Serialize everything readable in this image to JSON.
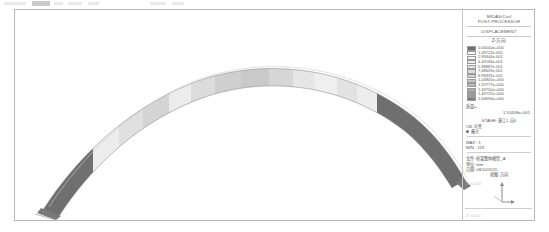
{
  "window": {
    "title": "MIDAS/Civil Post-Processor Displacement Contour"
  },
  "legend": {
    "header_lines": [
      "MIDAS/Civil",
      "POST-PROCESSOR",
      "DISPLACEMENT"
    ],
    "component": "Z-方向",
    "scale_rows": [
      {
        "value": "0.00000e+000",
        "color": "#6f6f6f"
      },
      {
        "value": "1.49722e-001",
        "color": "#ffffff"
      },
      {
        "value": "2.99444e-001",
        "color": "#f4f4f4"
      },
      {
        "value": "4.49166e-001",
        "color": "#ededed"
      },
      {
        "value": "5.98887e-001",
        "color": "#e4e4e4"
      },
      {
        "value": "7.48609e-001",
        "color": "#dcdcdc"
      },
      {
        "value": "8.98331e-001",
        "color": "#d2d2d2"
      },
      {
        "value": "1.04805e+000",
        "color": "#c6c6c6"
      },
      {
        "value": "1.19777e+000",
        "color": "#bbbbbb"
      },
      {
        "value": "1.34750e+000",
        "color": "#ababab"
      },
      {
        "value": "1.49722e+000",
        "color": "#9a9a9a"
      },
      {
        "value": "1.64694e+000",
        "color": "#7e7e7e"
      }
    ],
    "mass_label": "质量=",
    "mass_value": "1.51658e+001",
    "stage_label": "STAGE: 施工1-自4",
    "cb_label": "CB: 자중",
    "load_label": "最大",
    "max_label": "MAX : 1",
    "min_label": "MIN : 123",
    "file_label": "文件: 桥梁整体模型_A",
    "unit_label": "单位: mm",
    "date_label": "日期: 08/10/2011",
    "view_label": "视图-方向",
    "footer_left": "X: 0.000",
    "footer_bottom": "Z: 0.000"
  },
  "model": {
    "description": "arch-rib displacement contour, banded grayscale",
    "axis_glyph": "orientation-triad",
    "segments": [
      {
        "name": "left-haunch",
        "color": "#6f6f6f"
      },
      {
        "name": "left-quarter-a",
        "color": "#e9e9e9"
      },
      {
        "name": "left-quarter-b",
        "color": "#d6d6d6"
      },
      {
        "name": "left-crown-a",
        "color": "#efefef"
      },
      {
        "name": "crown-dark",
        "color": "#c9c9c9"
      },
      {
        "name": "crown-light",
        "color": "#e3e3e3"
      },
      {
        "name": "right-crown-a",
        "color": "#dcdcdc"
      },
      {
        "name": "right-quarter",
        "color": "#ececec"
      },
      {
        "name": "right-haunch",
        "color": "#6f6f6f"
      }
    ]
  }
}
